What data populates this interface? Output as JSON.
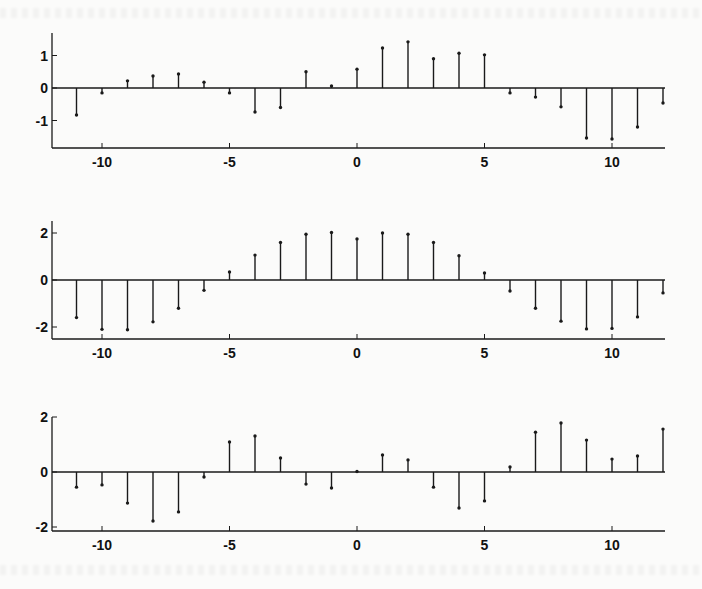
{
  "figure": {
    "background": "#fbfbfa",
    "ink_color": "#1a1a1a"
  },
  "chart_data": [
    {
      "type": "stem",
      "title": "",
      "xlabel": "",
      "ylabel": "",
      "x": [
        -11,
        -10,
        -9,
        -8,
        -7,
        -6,
        -5,
        -4,
        -3,
        -2,
        -1,
        0,
        1,
        2,
        3,
        4,
        5,
        6,
        7,
        8,
        9,
        10,
        11,
        12
      ],
      "values": [
        -0.83,
        -0.15,
        0.22,
        0.37,
        0.43,
        0.18,
        -0.15,
        -0.74,
        -0.6,
        0.5,
        0.06,
        0.58,
        1.23,
        1.42,
        0.9,
        1.07,
        1.02,
        -0.15,
        -0.28,
        -0.58,
        -1.54,
        -1.57,
        -1.2,
        -0.46
      ],
      "xlim": [
        -12,
        12
      ],
      "ylim": [
        -1.85,
        1.7
      ],
      "xticks": [
        -10,
        -5,
        0,
        5,
        10
      ],
      "xtick_labels": [
        "-10",
        "-5",
        "0",
        "5",
        "10"
      ],
      "yticks": [
        1,
        0,
        -1
      ],
      "ytick_labels": [
        "1",
        "0",
        "-1"
      ],
      "grid": false,
      "layout": {
        "x0px": 357,
        "xscale": 25.5,
        "y0px": 88,
        "yscale": 32.5,
        "axis_top": 33,
        "axis_bottom": 148,
        "left": 52,
        "right": 665
      }
    },
    {
      "type": "stem",
      "title": "",
      "xlabel": "",
      "ylabel": "",
      "x": [
        -11,
        -10,
        -9,
        -8,
        -7,
        -6,
        -5,
        -4,
        -3,
        -2,
        -1,
        0,
        1,
        2,
        3,
        4,
        5,
        6,
        7,
        8,
        9,
        10,
        11,
        12
      ],
      "values": [
        -1.6,
        -2.1,
        -2.12,
        -1.78,
        -1.2,
        -0.44,
        0.34,
        1.06,
        1.6,
        1.95,
        2.02,
        1.75,
        2.0,
        1.95,
        1.6,
        1.03,
        0.3,
        -0.47,
        -1.2,
        -1.75,
        -2.08,
        -2.06,
        -1.57,
        -0.55
      ],
      "xlim": [
        -12,
        12
      ],
      "ylim": [
        -2.5,
        2.5
      ],
      "xticks": [
        -10,
        -5,
        0,
        5,
        10
      ],
      "xtick_labels": [
        "-10",
        "-5",
        "0",
        "5",
        "10"
      ],
      "yticks": [
        2,
        0,
        -2
      ],
      "ytick_labels": [
        "2",
        "0",
        "-2"
      ],
      "grid": false,
      "layout": {
        "x0px": 357,
        "xscale": 25.5,
        "y0px": 280,
        "yscale": 23.5,
        "axis_top": 221,
        "axis_bottom": 339,
        "left": 52,
        "right": 665
      }
    },
    {
      "type": "stem",
      "title": "",
      "xlabel": "",
      "ylabel": "",
      "x": [
        -11,
        -10,
        -9,
        -8,
        -7,
        -6,
        -5,
        -4,
        -3,
        -2,
        -1,
        0,
        1,
        2,
        3,
        4,
        5,
        6,
        7,
        8,
        9,
        10,
        11,
        12
      ],
      "values": [
        -0.55,
        -0.47,
        -1.13,
        -1.78,
        -1.45,
        -0.18,
        1.09,
        1.31,
        0.51,
        -0.44,
        -0.58,
        0.02,
        0.62,
        0.44,
        -0.55,
        -1.31,
        -1.05,
        0.18,
        1.45,
        1.78,
        1.16,
        0.47,
        0.58,
        1.56
      ],
      "xlim": [
        -12,
        12
      ],
      "ylim": [
        -2.1,
        2.0
      ],
      "xticks": [
        -10,
        -5,
        0,
        5,
        10
      ],
      "xtick_labels": [
        "-10",
        "-5",
        "0",
        "5",
        "10"
      ],
      "yticks": [
        2,
        0,
        -2
      ],
      "ytick_labels": [
        "2",
        "0",
        "-2"
      ],
      "grid": false,
      "layout": {
        "x0px": 357,
        "xscale": 25.5,
        "y0px": 472,
        "yscale": 27.5,
        "axis_top": 417,
        "axis_bottom": 531,
        "left": 52,
        "right": 665
      }
    }
  ]
}
